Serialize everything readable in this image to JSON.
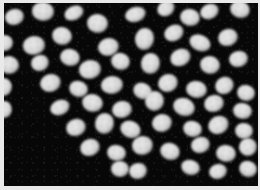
{
  "image": {
    "kind": "fluorescence-micrograph",
    "subject": "cell nuclei",
    "caption": "",
    "width_px": 260,
    "height_px": 190,
    "border_color": "#e9e9e9",
    "background_color": "#070707",
    "nucleus_core_color": "#dcdcdc",
    "nucleus_edge_color": "#606060",
    "nuclei_count": 62,
    "notes": "No text, labels, scale bar or UI chrome rendered in the image."
  },
  "field": {
    "left": 4,
    "top": 3,
    "width": 254,
    "height": 183
  },
  "nuclei": [
    {
      "x": 10,
      "y": 14,
      "w": 19,
      "h": 16,
      "r": -14
    },
    {
      "x": 39,
      "y": 8,
      "w": 22,
      "h": 19,
      "r": 8
    },
    {
      "x": 70,
      "y": 10,
      "w": 20,
      "h": 14,
      "r": -24
    },
    {
      "x": 93,
      "y": 20,
      "w": 21,
      "h": 19,
      "r": 10
    },
    {
      "x": 131,
      "y": 11,
      "w": 21,
      "h": 15,
      "r": -16
    },
    {
      "x": 162,
      "y": 5,
      "w": 18,
      "h": 15,
      "r": -30
    },
    {
      "x": 186,
      "y": 14,
      "w": 20,
      "h": 17,
      "r": 14
    },
    {
      "x": 205,
      "y": 8,
      "w": 19,
      "h": 15,
      "r": -22
    },
    {
      "x": 236,
      "y": 6,
      "w": 20,
      "h": 17,
      "r": 20
    },
    {
      "x": 0,
      "y": 40,
      "w": 17,
      "h": 16,
      "r": 0
    },
    {
      "x": 30,
      "y": 42,
      "w": 22,
      "h": 19,
      "r": -8
    },
    {
      "x": 58,
      "y": 33,
      "w": 20,
      "h": 18,
      "r": 18
    },
    {
      "x": 104,
      "y": 44,
      "w": 21,
      "h": 18,
      "r": -12
    },
    {
      "x": 140,
      "y": 36,
      "w": 19,
      "h": 22,
      "r": 8
    },
    {
      "x": 170,
      "y": 30,
      "w": 20,
      "h": 16,
      "r": -26
    },
    {
      "x": 196,
      "y": 40,
      "w": 22,
      "h": 16,
      "r": 24
    },
    {
      "x": 224,
      "y": 34,
      "w": 20,
      "h": 17,
      "r": -18
    },
    {
      "x": 5,
      "y": 62,
      "w": 20,
      "h": 18,
      "r": 12
    },
    {
      "x": 36,
      "y": 60,
      "w": 18,
      "h": 16,
      "r": -20
    },
    {
      "x": 66,
      "y": 54,
      "w": 20,
      "h": 17,
      "r": 16
    },
    {
      "x": 86,
      "y": 66,
      "w": 22,
      "h": 19,
      "r": -10
    },
    {
      "x": 116,
      "y": 58,
      "w": 19,
      "h": 17,
      "r": 22
    },
    {
      "x": 146,
      "y": 60,
      "w": 19,
      "h": 21,
      "r": 6
    },
    {
      "x": 176,
      "y": 54,
      "w": 21,
      "h": 17,
      "r": -24
    },
    {
      "x": 206,
      "y": 62,
      "w": 20,
      "h": 18,
      "r": 14
    },
    {
      "x": 234,
      "y": 56,
      "w": 19,
      "h": 16,
      "r": -12
    },
    {
      "x": 0,
      "y": 84,
      "w": 16,
      "h": 18,
      "r": 0
    },
    {
      "x": 46,
      "y": 80,
      "w": 21,
      "h": 18,
      "r": -16
    },
    {
      "x": 74,
      "y": 86,
      "w": 19,
      "h": 16,
      "r": 20
    },
    {
      "x": 108,
      "y": 82,
      "w": 22,
      "h": 18,
      "r": -6
    },
    {
      "x": 138,
      "y": 88,
      "w": 19,
      "h": 16,
      "r": 26
    },
    {
      "x": 164,
      "y": 80,
      "w": 20,
      "h": 18,
      "r": -20
    },
    {
      "x": 192,
      "y": 86,
      "w": 21,
      "h": 17,
      "r": 10
    },
    {
      "x": 220,
      "y": 82,
      "w": 19,
      "h": 17,
      "r": -28
    },
    {
      "x": 242,
      "y": 90,
      "w": 18,
      "h": 16,
      "r": 16
    },
    {
      "x": 0,
      "y": 106,
      "w": 15,
      "h": 17,
      "r": 0
    },
    {
      "x": 56,
      "y": 104,
      "w": 20,
      "h": 15,
      "r": -22
    },
    {
      "x": 88,
      "y": 100,
      "w": 21,
      "h": 18,
      "r": 14
    },
    {
      "x": 118,
      "y": 106,
      "w": 20,
      "h": 17,
      "r": -10
    },
    {
      "x": 150,
      "y": 98,
      "w": 19,
      "h": 20,
      "r": 6
    },
    {
      "x": 180,
      "y": 104,
      "w": 22,
      "h": 18,
      "r": 22
    },
    {
      "x": 210,
      "y": 100,
      "w": 20,
      "h": 17,
      "r": -16
    },
    {
      "x": 238,
      "y": 108,
      "w": 19,
      "h": 16,
      "r": 12
    },
    {
      "x": 72,
      "y": 124,
      "w": 20,
      "h": 17,
      "r": -18
    },
    {
      "x": 100,
      "y": 120,
      "w": 19,
      "h": 21,
      "r": 8
    },
    {
      "x": 126,
      "y": 126,
      "w": 21,
      "h": 17,
      "r": 24
    },
    {
      "x": 158,
      "y": 120,
      "w": 20,
      "h": 18,
      "r": -12
    },
    {
      "x": 188,
      "y": 126,
      "w": 19,
      "h": 16,
      "r": 18
    },
    {
      "x": 214,
      "y": 122,
      "w": 21,
      "h": 18,
      "r": -24
    },
    {
      "x": 240,
      "y": 128,
      "w": 18,
      "h": 16,
      "r": 10
    },
    {
      "x": 86,
      "y": 144,
      "w": 20,
      "h": 17,
      "r": -20
    },
    {
      "x": 112,
      "y": 150,
      "w": 19,
      "h": 16,
      "r": 14
    },
    {
      "x": 138,
      "y": 142,
      "w": 21,
      "h": 19,
      "r": -8
    },
    {
      "x": 166,
      "y": 148,
      "w": 20,
      "h": 17,
      "r": 22
    },
    {
      "x": 196,
      "y": 142,
      "w": 19,
      "h": 16,
      "r": -16
    },
    {
      "x": 222,
      "y": 150,
      "w": 20,
      "h": 17,
      "r": 12
    },
    {
      "x": 244,
      "y": 144,
      "w": 18,
      "h": 18,
      "r": -20
    },
    {
      "x": 116,
      "y": 166,
      "w": 18,
      "h": 16,
      "r": 6
    },
    {
      "x": 134,
      "y": 168,
      "w": 18,
      "h": 16,
      "r": -10
    },
    {
      "x": 186,
      "y": 164,
      "w": 19,
      "h": 15,
      "r": 18
    },
    {
      "x": 214,
      "y": 168,
      "w": 18,
      "h": 15,
      "r": -14
    },
    {
      "x": 244,
      "y": 166,
      "w": 18,
      "h": 16,
      "r": 24
    }
  ]
}
